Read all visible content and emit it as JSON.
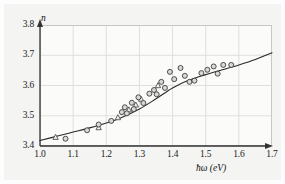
{
  "chart_data": {
    "type": "scatter",
    "title": "",
    "annotation": "GaAs",
    "xlabel": "ħω (eV)",
    "ylabel": "n",
    "xlim": [
      1.0,
      1.7
    ],
    "ylim": [
      3.4,
      3.8
    ],
    "xticks": [
      "1.0",
      "1.1",
      "1.2",
      "1.3",
      "1.4",
      "1.5",
      "1.6",
      "1.7"
    ],
    "yticks": [
      "3.4",
      "3.5",
      "3.6",
      "3.7",
      "3.8"
    ],
    "grid": true,
    "legend": "none",
    "series": [
      {
        "name": "triangles",
        "marker": "triangle",
        "points": [
          [
            1.047,
            3.429
          ],
          [
            1.177,
            3.461
          ],
          [
            1.235,
            3.494
          ],
          [
            1.268,
            3.52
          ],
          [
            1.289,
            3.536
          ],
          [
            1.305,
            3.555
          ],
          [
            1.356,
            3.6
          ]
        ]
      },
      {
        "name": "circles",
        "marker": "circle",
        "points": [
          [
            1.077,
            3.424
          ],
          [
            1.142,
            3.452
          ],
          [
            1.177,
            3.471
          ],
          [
            1.215,
            3.483
          ],
          [
            1.247,
            3.512
          ],
          [
            1.256,
            3.528
          ],
          [
            1.262,
            3.508
          ],
          [
            1.277,
            3.543
          ],
          [
            1.283,
            3.522
          ],
          [
            1.297,
            3.561
          ],
          [
            1.312,
            3.542
          ],
          [
            1.33,
            3.573
          ],
          [
            1.344,
            3.585
          ],
          [
            1.352,
            3.571
          ],
          [
            1.366,
            3.612
          ],
          [
            1.377,
            3.592
          ],
          [
            1.392,
            3.645
          ],
          [
            1.405,
            3.621
          ],
          [
            1.424,
            3.658
          ],
          [
            1.437,
            3.632
          ],
          [
            1.451,
            3.612
          ],
          [
            1.466,
            3.616
          ],
          [
            1.487,
            3.641
          ],
          [
            1.505,
            3.652
          ],
          [
            1.524,
            3.663
          ],
          [
            1.536,
            3.639
          ],
          [
            1.553,
            3.668
          ],
          [
            1.577,
            3.668
          ]
        ]
      }
    ],
    "fit_curve": {
      "name": "model",
      "points": [
        [
          1.0,
          3.418
        ],
        [
          1.05,
          3.432
        ],
        [
          1.1,
          3.446
        ],
        [
          1.15,
          3.46
        ],
        [
          1.2,
          3.476
        ],
        [
          1.25,
          3.496
        ],
        [
          1.3,
          3.522
        ],
        [
          1.35,
          3.556
        ],
        [
          1.4,
          3.592
        ],
        [
          1.45,
          3.618
        ],
        [
          1.5,
          3.636
        ],
        [
          1.55,
          3.652
        ],
        [
          1.6,
          3.668
        ],
        [
          1.65,
          3.686
        ],
        [
          1.7,
          3.708
        ]
      ]
    }
  }
}
